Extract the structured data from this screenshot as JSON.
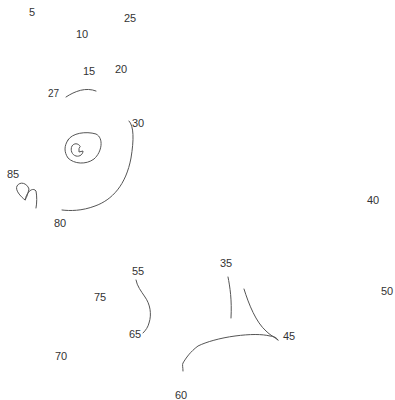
{
  "puzzle": {
    "type": "connect-the-dots",
    "labels": [
      {
        "text": "5",
        "x": 29,
        "y": 7
      },
      {
        "text": "25",
        "x": 124,
        "y": 13
      },
      {
        "text": "10",
        "x": 76,
        "y": 29
      },
      {
        "text": "15",
        "x": 83,
        "y": 66
      },
      {
        "text": "20",
        "x": 115,
        "y": 64
      },
      {
        "text": "27",
        "x": 48,
        "y": 89
      },
      {
        "text": "30",
        "x": 132,
        "y": 118
      },
      {
        "text": "85",
        "x": 7,
        "y": 169
      },
      {
        "text": "40",
        "x": 367,
        "y": 195
      },
      {
        "text": "80",
        "x": 54,
        "y": 218
      },
      {
        "text": "35",
        "x": 220,
        "y": 258
      },
      {
        "text": "55",
        "x": 132,
        "y": 266
      },
      {
        "text": "50",
        "x": 381,
        "y": 286
      },
      {
        "text": "75",
        "x": 94,
        "y": 292
      },
      {
        "text": "45",
        "x": 283,
        "y": 331
      },
      {
        "text": "65",
        "x": 129,
        "y": 329
      },
      {
        "text": "70",
        "x": 55,
        "y": 351
      },
      {
        "text": "60",
        "x": 175,
        "y": 390
      }
    ],
    "stroke_color": "#555555",
    "label_color": "#333333",
    "background": "#ffffff"
  }
}
